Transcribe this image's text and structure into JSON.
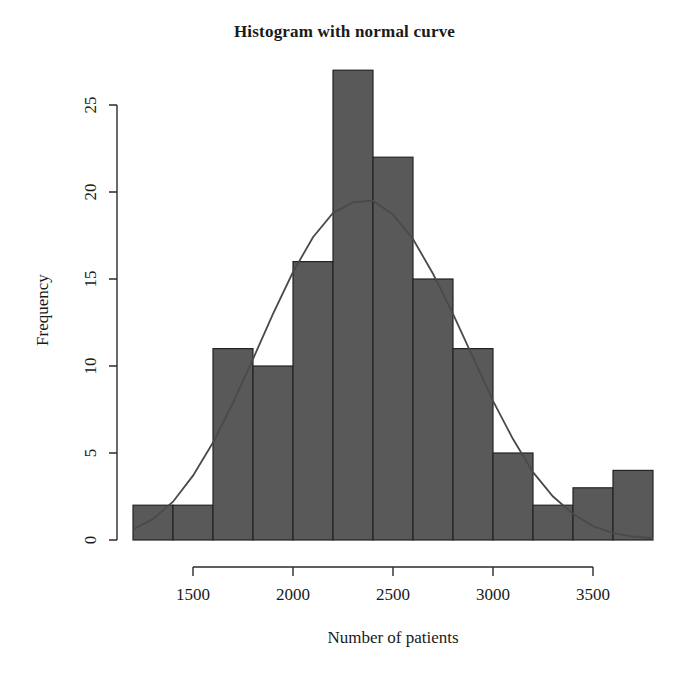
{
  "chart": {
    "title": "Histogram with normal curve",
    "xlabel": "Number of patients",
    "ylabel": "Frequency"
  },
  "chart_data": {
    "type": "bar",
    "title": "Histogram with normal curve",
    "xlabel": "Number of patients",
    "ylabel": "Frequency",
    "grid": false,
    "legend": "none",
    "bin_width": 200,
    "bin_edges": [
      1200,
      1400,
      1600,
      1800,
      2000,
      2200,
      2400,
      2600,
      2800,
      3000,
      3200,
      3400,
      3600,
      3800
    ],
    "categories": [
      "1200-1400",
      "1400-1600",
      "1600-1800",
      "1800-2000",
      "2000-2200",
      "2200-2400",
      "2400-2600",
      "2600-2800",
      "2800-3000",
      "3000-3200",
      "3200-3400",
      "3400-3600",
      "3600-3800"
    ],
    "bin_centers": [
      1300,
      1500,
      1700,
      1900,
      2100,
      2300,
      2500,
      2700,
      2900,
      3100,
      3300,
      3500,
      3700
    ],
    "values": [
      2,
      2,
      11,
      10,
      16,
      27,
      22,
      15,
      11,
      5,
      2,
      3,
      4
    ],
    "xlim": [
      1200,
      3800
    ],
    "ylim": [
      0,
      25
    ],
    "xticks": [
      1500,
      2000,
      2500,
      3000,
      3500
    ],
    "xticklabels": [
      "1500",
      "2000",
      "2500",
      "3000",
      "3500"
    ],
    "yticks": [
      0,
      5,
      10,
      15,
      20,
      25
    ],
    "yticklabels": [
      "0",
      "5",
      "10",
      "15",
      "20",
      "25"
    ],
    "overlay": {
      "type": "line",
      "name": "normal curve",
      "mean": 2400,
      "sd": 430,
      "peak_value": 19.5,
      "x": [
        1200,
        1300,
        1400,
        1500,
        1600,
        1700,
        1800,
        1900,
        2000,
        2100,
        2200,
        2300,
        2400,
        2500,
        2600,
        2700,
        2800,
        2900,
        3000,
        3100,
        3200,
        3300,
        3400,
        3500,
        3600,
        3700,
        3800
      ],
      "y": [
        0.6,
        1.2,
        2.2,
        3.7,
        5.6,
        7.9,
        10.4,
        13.0,
        15.4,
        17.4,
        18.8,
        19.4,
        19.5,
        18.7,
        17.3,
        15.3,
        13.0,
        10.5,
        8.0,
        5.8,
        3.9,
        2.5,
        1.5,
        0.8,
        0.4,
        0.2,
        0.1
      ]
    },
    "bar_fill_color": "#595959",
    "bar_border_color": "#232323",
    "curve_color": "#4a4a4a"
  },
  "geometry": {
    "x_origin_px": 133,
    "px_per_unit_x": 0.2,
    "y_baseline_px": 540,
    "px_per_unit_y": 17.4
  }
}
